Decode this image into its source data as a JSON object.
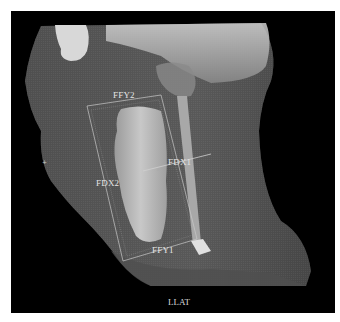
{
  "figure": {
    "view_label": "LLAT",
    "annotations": [
      {
        "id": "ffy2",
        "text": "FFY2"
      },
      {
        "id": "fdx1",
        "text": "FDX1"
      },
      {
        "id": "fdx2",
        "text": "FDX2"
      },
      {
        "id": "ffy1",
        "text": "FFY1"
      }
    ],
    "colors": {
      "background": "#000000",
      "tissue": "#5a5a5a",
      "airway": "#b4b4b4",
      "annotation": "#e6e6e6"
    }
  }
}
